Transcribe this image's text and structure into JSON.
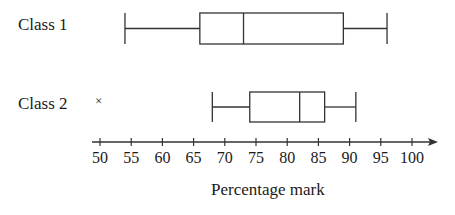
{
  "chart_data": {
    "type": "boxplot",
    "title": "",
    "xlabel": "Percentage mark",
    "ylabel": "",
    "xlim": [
      50,
      100
    ],
    "x_ticks": [
      50,
      55,
      60,
      65,
      70,
      75,
      80,
      85,
      90,
      95,
      100
    ],
    "grid": false,
    "orientation": "horizontal",
    "series": [
      {
        "name": "Class 1",
        "min": 54,
        "q1": 66,
        "median": 73,
        "q3": 89,
        "max": 96,
        "outliers": []
      },
      {
        "name": "Class 2",
        "min": 68,
        "q1": 74,
        "median": 82,
        "q3": 86,
        "max": 91,
        "outliers": [
          50
        ]
      }
    ]
  },
  "labels": {
    "class1": "Class 1",
    "class2": "Class 2",
    "outlier_marker": "×",
    "xlabel": "Percentage mark",
    "ticks": [
      "50",
      "55",
      "60",
      "65",
      "70",
      "75",
      "80",
      "85",
      "90",
      "95",
      "100"
    ]
  }
}
